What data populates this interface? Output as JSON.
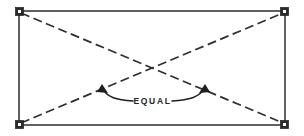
{
  "diagram": {
    "label": "EQUAL",
    "colors": {
      "outline": "#3a3a3a",
      "diagonal": "#2f2f2f",
      "leader": "#1f1f1f",
      "marker": "#2b2b2b",
      "text": "#262626",
      "background": "#ffffff"
    },
    "rectangle": {
      "name": "frame-outline",
      "x": 19,
      "y": 11,
      "width": 266,
      "height": 114
    },
    "corners": [
      {
        "name": "corner-top-left",
        "x": 19,
        "y": 11
      },
      {
        "name": "corner-top-right",
        "x": 285,
        "y": 11
      },
      {
        "name": "corner-bottom-left",
        "x": 19,
        "y": 125
      },
      {
        "name": "corner-bottom-right",
        "x": 285,
        "y": 125
      }
    ],
    "diagonals": [
      {
        "name": "diagonal-tl-br",
        "x1": 21,
        "y1": 13,
        "x2": 283,
        "y2": 123
      },
      {
        "name": "diagonal-bl-tr",
        "x1": 21,
        "y1": 123,
        "x2": 283,
        "y2": 13
      }
    ],
    "leaders": [
      {
        "name": "leader-left",
        "path": "M 133 101 C 118 100 106 98 102 87"
      },
      {
        "name": "leader-right",
        "path": "M 172 101 C 188 100 200 98 205 87"
      }
    ],
    "arrows": [
      {
        "name": "arrow-left",
        "points": "102,84 108,93 97,92"
      },
      {
        "name": "arrow-right",
        "points": "205,84 210,92 199,93"
      }
    ],
    "label_position": {
      "x": 152.5,
      "y": 101
    }
  }
}
